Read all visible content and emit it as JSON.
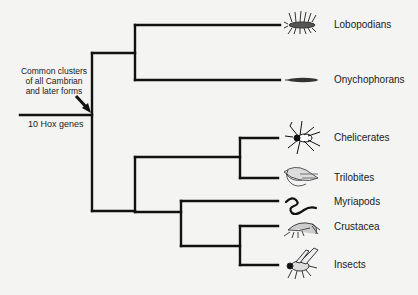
{
  "diagram": {
    "type": "phylogenetic-tree",
    "annotation": {
      "lines": [
        "Common clusters",
        "of all Cambrian",
        "and later forms"
      ]
    },
    "root_label": "10 Hox genes",
    "taxa": [
      {
        "name": "Lobopodians",
        "icon": "lobopodian-icon"
      },
      {
        "name": "Onychophorans",
        "icon": "velvet-worm-icon"
      },
      {
        "name": "Chelicerates",
        "icon": "spider-icon"
      },
      {
        "name": "Trilobites",
        "icon": "trilobite-icon"
      },
      {
        "name": "Myriapods",
        "icon": "millipede-icon"
      },
      {
        "name": "Crustacea",
        "icon": "shrimp-icon"
      },
      {
        "name": "Insects",
        "icon": "fly-icon"
      }
    ],
    "colors": {
      "line": "#111111",
      "background": "#f4f4f2"
    }
  }
}
